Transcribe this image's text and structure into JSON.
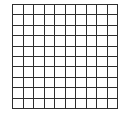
{
  "grid": {
    "rows": 10,
    "cols": 10,
    "line_color": "#2e2e2e",
    "cell_fill": "#ffffff"
  }
}
